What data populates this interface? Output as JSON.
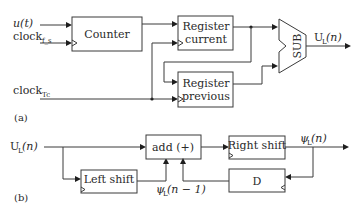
{
  "panel_a": {
    "caption": "(a)",
    "inputs": {
      "u_label": "u(t)",
      "clock_main": "clock",
      "clock_main_sub": "f_s",
      "clock_tc": "clock",
      "clock_tc_sub": "Tc"
    },
    "blocks": {
      "counter": "Counter",
      "register_current_line1": "Register",
      "register_current_line2": "current",
      "register_previous_line1": "Register",
      "register_previous_line2": "previous",
      "sub": "SUB"
    },
    "output": {
      "label_main": "U",
      "label_sub": "L",
      "label_arg": "(n)"
    }
  },
  "panel_b": {
    "caption": "(b)",
    "input": {
      "label_main": "U",
      "label_sub": "L",
      "label_arg": "(n)"
    },
    "blocks": {
      "add": "add (+)",
      "left_shift": "Left shift",
      "right_shift": "Right shift",
      "delay": "D"
    },
    "output": {
      "label_main": "ψ",
      "label_sub": "L",
      "label_arg": "(n)"
    },
    "feedback": {
      "label_main": "ψ",
      "label_sub": "L",
      "label_arg": "(n − 1)"
    }
  },
  "colors": {
    "line": "#3a3a3a",
    "arrow": "#1e1e1e",
    "background": "#ffffff"
  }
}
